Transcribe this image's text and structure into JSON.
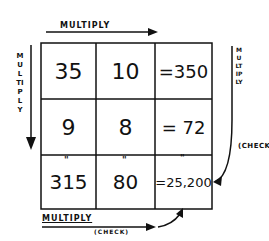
{
  "labels": {
    "top": "MULTIPLY",
    "left": "MULTIPLY",
    "right": "MULTIPLY",
    "right_check": "(CHECK",
    "bottom": "MULTIPLY",
    "bottom_check": "(CHECK)"
  },
  "grid": {
    "rows": [
      [
        "35",
        "10",
        "=350"
      ],
      [
        "9",
        "8",
        "= 72"
      ],
      [
        "315",
        "80",
        "=25,200"
      ]
    ],
    "ditto_mark": "\""
  }
}
